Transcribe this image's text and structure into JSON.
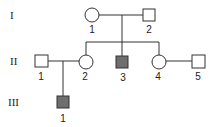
{
  "diagram": {
    "type": "pedigree",
    "generations": [
      {
        "label": "I"
      },
      {
        "label": "II"
      },
      {
        "label": "III"
      }
    ],
    "individuals": [
      {
        "id": "I-1",
        "number": "1",
        "sex": "female",
        "affected": false
      },
      {
        "id": "I-2",
        "number": "2",
        "sex": "male",
        "affected": false
      },
      {
        "id": "II-1",
        "number": "1",
        "sex": "male",
        "affected": false
      },
      {
        "id": "II-2",
        "number": "2",
        "sex": "female",
        "affected": false
      },
      {
        "id": "II-3",
        "number": "3",
        "sex": "male",
        "affected": true
      },
      {
        "id": "II-4",
        "number": "4",
        "sex": "female",
        "affected": false
      },
      {
        "id": "II-5",
        "number": "5",
        "sex": "male",
        "affected": false
      },
      {
        "id": "III-1",
        "number": "1",
        "sex": "male",
        "affected": true
      }
    ],
    "colors": {
      "affected": "#6e6e6e",
      "line": "#333333"
    }
  }
}
